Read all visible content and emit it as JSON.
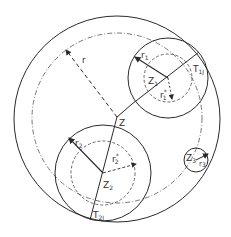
{
  "diagram": {
    "type": "nested circles geometry diagram",
    "colors": {
      "stroke": "#2a2a2a",
      "background": "#ffffff"
    },
    "outer_circle": {
      "cx": 117,
      "cy": 119,
      "r": 103,
      "style": "solid"
    },
    "reference_circle": {
      "cx": 117,
      "cy": 118,
      "r": 85,
      "style": "dash-dot"
    },
    "center_point": {
      "label": "Z",
      "x": 117,
      "y": 117
    },
    "radius_r": {
      "label": "r",
      "from": [
        117,
        117
      ],
      "to": [
        66,
        50
      ],
      "style": "dashed"
    },
    "circles": [
      {
        "id": "Z1",
        "label": "Z",
        "label_sub": "1",
        "cx": 168,
        "cy": 78,
        "r": 40,
        "radius_label": "r",
        "radius_sub": "1",
        "inner_r": 24,
        "inner_label": "r",
        "inner_sub": "1",
        "inner_sup": "*",
        "tangent_label": "T",
        "tangent_sub": "1J"
      },
      {
        "id": "Z2",
        "label": "Z",
        "label_sub": "2",
        "cx": 103,
        "cy": 173,
        "r": 48,
        "radius_label": "r",
        "radius_sub": "2",
        "inner_r": 32,
        "inner_label": "r",
        "inner_sub": "2",
        "inner_sup": "*",
        "tangent_label": "T",
        "tangent_sub": "2J"
      },
      {
        "id": "Z3",
        "label": "Z",
        "label_sub": "3",
        "cx": 196,
        "cy": 160,
        "r": 12,
        "radius_label": "r",
        "radius_sub": "3"
      }
    ]
  }
}
